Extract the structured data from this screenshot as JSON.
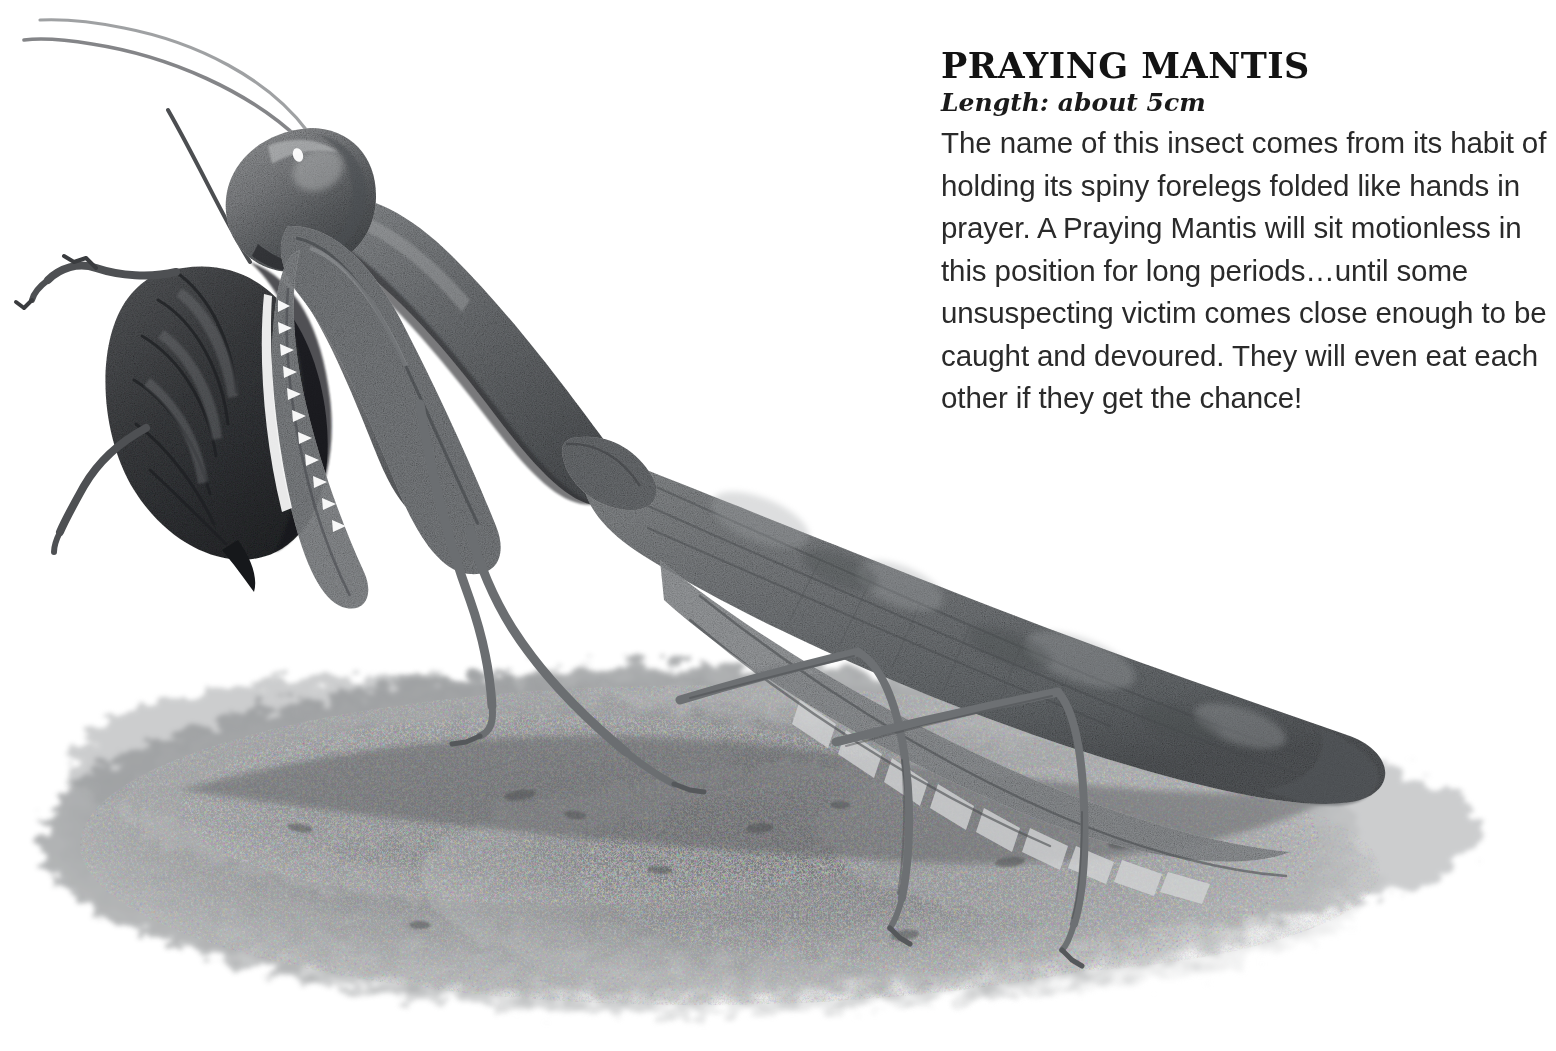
{
  "page": {
    "background_color": "#ffffff",
    "width": 1556,
    "height": 1051
  },
  "text_panel": {
    "title": "PRAYING MANTIS",
    "length_label": "Length: about 5cm",
    "body": "The name of this insect comes from its habit of holding its spiny forelegs folded like hands in prayer. A Praying Mantis will sit motionless in this position for long periods…until some unsuspecting victim comes close enough to be caught and devoured. They will even eat each other if they get the chance!",
    "title_color": "#131313",
    "length_color": "#1a1a1a",
    "body_color": "#2a2a2a"
  },
  "illustration": {
    "subject": "praying-mantis",
    "style": "watercolour-greyscale",
    "parts": [
      "antenna-left",
      "antenna-right",
      "head",
      "eye-highlight",
      "pronotum",
      "foreleg-near",
      "foreleg-far",
      "foreleg-spines",
      "abdomen",
      "wing-upper",
      "wing-lower",
      "midleg-left",
      "midleg-right",
      "hindleg-left",
      "hindleg-right",
      "ground-shadow"
    ],
    "colors": {
      "body_mid": "#7f8184",
      "body_dark": "#4e5053",
      "body_darkest": "#2b2d30",
      "body_light": "#a9abad",
      "highlight": "#d9dadb",
      "wing_mid": "#85888a",
      "wing_dark": "#5b5e61",
      "abdomen_dark": "#3a3c3f",
      "leg": "#737577",
      "ground_light": "#c9cacb",
      "ground_mid": "#9fa1a2",
      "ground_dark": "#76787a",
      "outline": "#3f4144"
    }
  }
}
